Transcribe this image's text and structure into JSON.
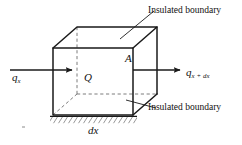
{
  "figure": {
    "type": "heat-conduction-control-volume-diagram",
    "background_color": "#ffffff",
    "line_color": "#1a1a1a",
    "labels": {
      "insulated_top": "Insulated boundary",
      "insulated_bottom": "Insulated boundary",
      "heat_in_base": "q",
      "heat_in_sub": "x",
      "heat_out_base": "q",
      "heat_out_sub": "x + dx",
      "internal_generation": "Q",
      "area": "A",
      "thickness_base": "d",
      "thickness_sub": "x"
    },
    "geometry": {
      "front_face": {
        "top_left": [
          53,
          48
        ],
        "top_right": [
          133,
          48
        ],
        "bottom_right": [
          133,
          115
        ],
        "bottom_left": [
          53,
          115
        ]
      },
      "back_face": {
        "top_left": [
          77,
          27
        ],
        "top_right": [
          157,
          27
        ],
        "bottom_right": [
          157,
          94
        ],
        "bottom_left": [
          77,
          94
        ]
      },
      "hidden_edges": [
        "back_left_vertical",
        "back_bottom",
        "back_left_top_connector"
      ]
    },
    "arrows": {
      "inlet": {
        "from": [
          10,
          70
        ],
        "to": [
          76,
          70
        ],
        "direction": "right"
      },
      "outlet": {
        "from": [
          133,
          70
        ],
        "to": [
          184,
          70
        ],
        "direction": "right"
      }
    },
    "leaders": {
      "top": {
        "from": [
          122,
          38
        ],
        "to": [
          154,
          11
        ]
      },
      "bottom": {
        "from": [
          126,
          100
        ],
        "to": [
          155,
          108
        ]
      }
    },
    "hatching": {
      "x_start": 52,
      "x_end": 135,
      "y": 116,
      "height": 6,
      "stroke_count": 18
    }
  }
}
